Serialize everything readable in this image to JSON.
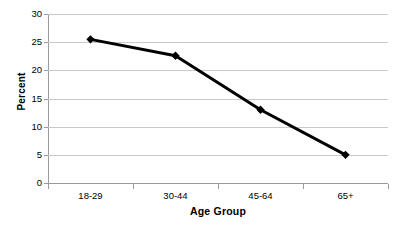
{
  "chart_data": {
    "type": "line",
    "title": "",
    "xlabel": "Age Group",
    "ylabel": "Percent",
    "categories": [
      "18-29",
      "30-44",
      "45-64",
      "65+"
    ],
    "values": [
      25.5,
      22.6,
      13.0,
      5.0
    ],
    "series": [
      {
        "name": "Percent",
        "values": [
          25.5,
          22.6,
          13.0,
          5.0
        ],
        "color": "#000000",
        "marker": "diamond",
        "line_width": 3
      }
    ],
    "ylim": [
      0,
      30
    ],
    "ytick_labels": [
      "0",
      "5",
      "10",
      "15",
      "20",
      "25",
      "30"
    ],
    "ytick_values": [
      0,
      5,
      10,
      15,
      20,
      25,
      30
    ],
    "grid": "horizontal",
    "gridline_color": "#c9c9c9",
    "legend": "none",
    "background_color": "#ffffff",
    "axis_color": "#9a9a9a"
  },
  "axes": {
    "y_title": "Percent",
    "x_title": "Age Group"
  }
}
